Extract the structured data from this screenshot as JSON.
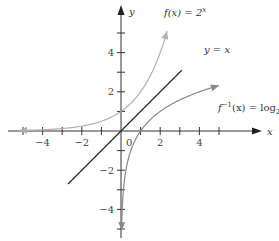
{
  "chart_data": {
    "type": "line",
    "title": "",
    "xlabel": "x",
    "ylabel": "y",
    "xlim": [
      -5.5,
      5.5
    ],
    "ylim": [
      -5.5,
      5.5
    ],
    "grid": false,
    "xticks": [
      -5,
      -4,
      -3,
      -2,
      -1,
      1,
      2,
      3,
      4,
      5
    ],
    "yticks": [
      -5,
      -4,
      -3,
      -2,
      -1,
      1,
      2,
      3,
      4,
      5
    ],
    "xtick_labels": [
      {
        "v": -4,
        "t": "-4"
      },
      {
        "v": -2,
        "t": "-2"
      },
      {
        "v": 2,
        "t": "2"
      },
      {
        "v": 4,
        "t": "4"
      }
    ],
    "ytick_labels": [
      {
        "v": 4,
        "t": "4"
      },
      {
        "v": 2,
        "t": "2"
      },
      {
        "v": -2,
        "t": "-2"
      },
      {
        "v": -4,
        "t": "-4"
      }
    ],
    "origin_label": "0",
    "series": [
      {
        "name": "f(x) = 2^x",
        "label_main": "f(x) = 2",
        "label_sup": "x",
        "color": "#b0b0b0",
        "function": "2^x",
        "x_range": [
          -5.2,
          2.35
        ]
      },
      {
        "name": "y = x",
        "label_main": "y = x",
        "color": "#2a2a2a",
        "function": "x",
        "x_range": [
          -2.7,
          3.1
        ]
      },
      {
        "name": "f^-1(x) = log_2 x",
        "label_main": "f",
        "label_sup": "−1",
        "label_rest": "(x) = log",
        "label_sub": "2",
        "label_end": "x",
        "color": "#8a8a8a",
        "function": "log2(x)",
        "x_range": [
          0.03,
          5.0
        ]
      }
    ]
  }
}
